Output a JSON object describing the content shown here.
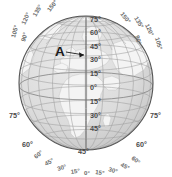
{
  "figure": {
    "type": "globe-orthographic-projection",
    "center_longitude": "0°",
    "center_latitude": "30°",
    "grid_interval_degrees": 15,
    "background_color": "#ffffff",
    "ocean_color": "#d8d8d8",
    "land_color": "#f2f2f2",
    "grid_color": "#a8a8a8",
    "outline_color": "#585858"
  },
  "annotation": {
    "marker_label": "A",
    "arrow": "leader-line-pointing-right"
  },
  "latitude_labels_center": [
    {
      "text": "75°",
      "value": 75
    },
    {
      "text": "60°",
      "value": 60
    },
    {
      "text": "45°",
      "value": 45
    },
    {
      "text": "30°",
      "value": 30
    },
    {
      "text": "15°",
      "value": 15
    },
    {
      "text": "0°",
      "value": 0
    },
    {
      "text": "15°",
      "value": -15
    },
    {
      "text": "30°",
      "value": -30
    },
    {
      "text": "45°",
      "value": -45
    }
  ],
  "latitude_labels_left": [
    {
      "text": "75°",
      "value": 75
    },
    {
      "text": "60°",
      "value": 60
    }
  ],
  "latitude_labels_right": [
    {
      "text": "75°",
      "value": 75
    },
    {
      "text": "60°",
      "value": 60
    }
  ],
  "longitude_labels_bottom": [
    {
      "text": "60°",
      "value": -60
    },
    {
      "text": "45°",
      "value": -45
    },
    {
      "text": "30°",
      "value": -30
    },
    {
      "text": "15°",
      "value": -15
    },
    {
      "text": "0°",
      "value": 0
    },
    {
      "text": "15°",
      "value": 15
    },
    {
      "text": "30°",
      "value": 30
    },
    {
      "text": "45°",
      "value": 45
    },
    {
      "text": "60°",
      "value": 60
    }
  ],
  "longitude_labels_top_left": [
    {
      "text": "150°",
      "value": -150
    },
    {
      "text": "135°",
      "value": -135
    },
    {
      "text": "120°",
      "value": -120
    },
    {
      "text": "105°",
      "value": -105
    },
    {
      "text": "90°",
      "value": -90
    }
  ],
  "longitude_labels_top_right": [
    {
      "text": "150°",
      "value": 150
    },
    {
      "text": "135°",
      "value": 135
    },
    {
      "text": "120°",
      "value": 120
    },
    {
      "text": "105°",
      "value": 105
    },
    {
      "text": "90°",
      "value": 90
    }
  ]
}
